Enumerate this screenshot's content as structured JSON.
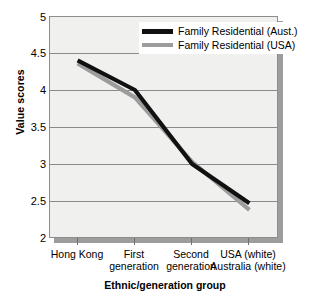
{
  "chart_data": {
    "type": "line",
    "title": "",
    "xlabel": "Ethnic/generation group",
    "ylabel": "Value scores",
    "categories": [
      "Hong Kong",
      "First generation",
      "Second generation",
      "USA (white) Australia (white)"
    ],
    "category_lines": [
      [
        "Hong Kong",
        ""
      ],
      [
        "First",
        "generation"
      ],
      [
        "Second",
        "generation"
      ],
      [
        "USA (white)",
        "Australia (white)"
      ]
    ],
    "ylim": [
      2,
      5
    ],
    "yticks": [
      "2",
      "2.5",
      "3",
      "3.5",
      "4",
      "4.5",
      "5"
    ],
    "ytick_values": [
      2,
      2.5,
      3,
      3.5,
      4,
      4.5,
      5
    ],
    "grid": true,
    "legend_position": "top-center",
    "series": [
      {
        "name": "Family Residential (Aust.)",
        "color": "#111111",
        "values": [
          4.4,
          4.0,
          3.0,
          2.47
        ]
      },
      {
        "name": "Family Residential (USA)",
        "color": "#9c9c9c",
        "values": [
          4.36,
          3.9,
          3.03,
          2.38
        ]
      }
    ]
  },
  "axis": {
    "ylabel": "Value scores",
    "xlabel": "Ethnic/generation group"
  },
  "legend": {
    "items": [
      {
        "label": "Family Residential (Aust.)"
      },
      {
        "label": "Family Residential (USA)"
      }
    ]
  }
}
